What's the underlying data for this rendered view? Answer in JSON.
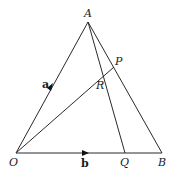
{
  "diagram": {
    "points": {
      "A": "A",
      "O": "O",
      "B": "B",
      "P": "P",
      "Q": "Q",
      "R": "R"
    },
    "vectors": {
      "a": "a",
      "b": "b"
    },
    "segments": [
      "OA",
      "AB",
      "OB",
      "OP",
      "AQ"
    ],
    "colors": {
      "stroke": "#2a2a2a",
      "background": "#ffffff"
    }
  }
}
